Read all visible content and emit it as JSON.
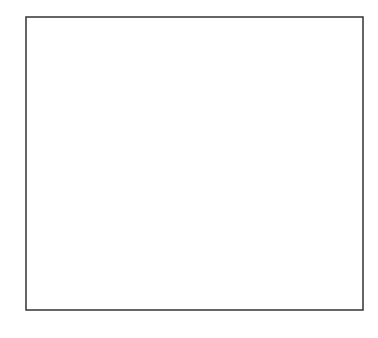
{
  "diagram": {
    "title": "",
    "frame": {
      "x": 26,
      "y": 17,
      "width": 337,
      "height": 293
    },
    "rods": [
      {
        "x": 51,
        "beads": 1
      },
      {
        "x": 103,
        "beads": 2
      },
      {
        "x": 155,
        "beads": 3
      },
      {
        "x": 207,
        "beads": 2
      },
      {
        "x": 259,
        "beads": 1
      },
      {
        "x": 311,
        "beads": null,
        "label": "?"
      }
    ],
    "bead_radius": 14,
    "unknown_label": "?",
    "colors": {
      "line": "#222222",
      "background": "#ffffff"
    }
  }
}
